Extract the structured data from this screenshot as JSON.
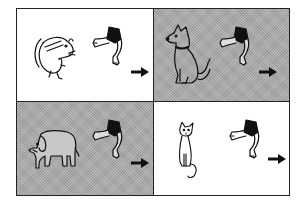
{
  "figure": {
    "layout": "2x2 grid",
    "cells": [
      {
        "animal": "mouse",
        "background": "white",
        "action": "walk-away",
        "arrow": "right"
      },
      {
        "animal": "dog",
        "background": "gray",
        "action": "walk-away",
        "arrow": "right"
      },
      {
        "animal": "elephant",
        "background": "gray",
        "action": "walk-away",
        "arrow": "right"
      },
      {
        "animal": "cat",
        "background": "white",
        "action": "walk-away",
        "arrow": "right"
      }
    ],
    "colors": {
      "border": "#222222",
      "shaded": "#a9a9a9",
      "light": "#ffffff",
      "ink": "#111111"
    }
  }
}
